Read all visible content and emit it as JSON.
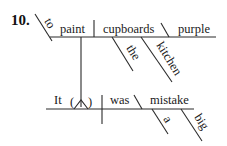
{
  "exercise": {
    "number": "10."
  },
  "diagram": {
    "type": "sentence-diagram",
    "sentence_words": {
      "infinitive_marker": "to",
      "infinitive_verb": "paint",
      "infinitive_object": "cupboards",
      "object_complement": "purple",
      "article_the": "the",
      "modifier_kitchen": "kitchen",
      "subject": "It",
      "placeholder_open": "(",
      "placeholder_close": ")",
      "verb": "was",
      "predicate_noun": "mistake",
      "article_a": "a",
      "modifier_big": "big"
    }
  }
}
